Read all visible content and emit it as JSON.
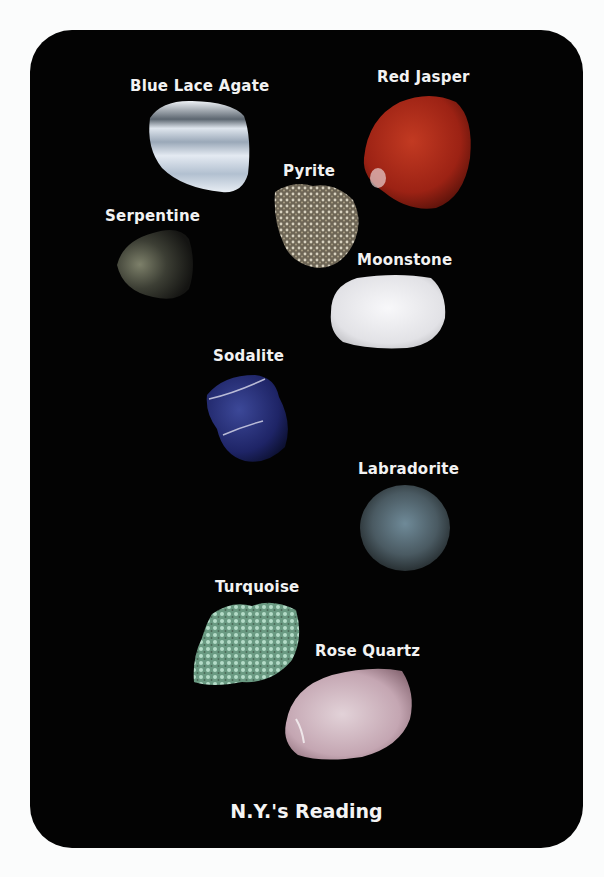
{
  "card": {
    "background": "#030303",
    "title": "N.Y.'s Reading"
  },
  "stones": [
    {
      "name": "Blue Lace Agate",
      "color": "#c9d4e0"
    },
    {
      "name": "Red Jasper",
      "color": "#a8261a"
    },
    {
      "name": "Pyrite",
      "color": "#8a8272"
    },
    {
      "name": "Serpentine",
      "color": "#4a4c3e"
    },
    {
      "name": "Moonstone",
      "color": "#e8e8ea"
    },
    {
      "name": "Sodalite",
      "color": "#2a3278"
    },
    {
      "name": "Labradorite",
      "color": "#4d5f68"
    },
    {
      "name": "Turquoise",
      "color": "#8fbfa6"
    },
    {
      "name": "Rose Quartz",
      "color": "#cdb2bc"
    }
  ]
}
